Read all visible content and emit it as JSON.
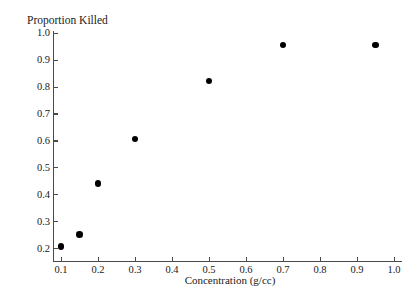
{
  "chart_data": {
    "type": "scatter",
    "title": "",
    "ylabel": "Proportion Killed",
    "xlabel": "Concentration (g/cc)",
    "xlim": [
      0.055,
      1.045
    ],
    "ylim": [
      0.17,
      1.0
    ],
    "grid": false,
    "legend": null,
    "xticks": [
      "0.1",
      "0.2",
      "0.3",
      "0.4",
      "0.5",
      "0.6",
      "0.7",
      "0.8",
      "0.9",
      "1.0"
    ],
    "xtick_values": [
      0.1,
      0.2,
      0.3,
      0.4,
      0.5,
      0.6,
      0.7,
      0.8,
      0.9,
      1.0
    ],
    "yticks": [
      "0.2",
      "0.3",
      "0.4",
      "0.5",
      "0.6",
      "0.7",
      "0.8",
      "0.9",
      "1.0"
    ],
    "ytick_values": [
      0.2,
      0.3,
      0.4,
      0.5,
      0.6,
      0.7,
      0.8,
      0.9,
      1.0
    ],
    "marker": "filled-circle",
    "marker_color": "#000000",
    "axis_color": "#4a4a4a",
    "points": [
      {
        "x": 0.1,
        "y": 0.205
      },
      {
        "x": 0.15,
        "y": 0.25
      },
      {
        "x": 0.2,
        "y": 0.44
      },
      {
        "x": 0.3,
        "y": 0.605
      },
      {
        "x": 0.5,
        "y": 0.82
      },
      {
        "x": 0.7,
        "y": 0.955
      },
      {
        "x": 0.95,
        "y": 0.955
      }
    ],
    "x": [
      0.1,
      0.15,
      0.2,
      0.3,
      0.5,
      0.7,
      0.95
    ],
    "values": [
      0.205,
      0.25,
      0.44,
      0.605,
      0.82,
      0.955,
      0.955
    ]
  }
}
